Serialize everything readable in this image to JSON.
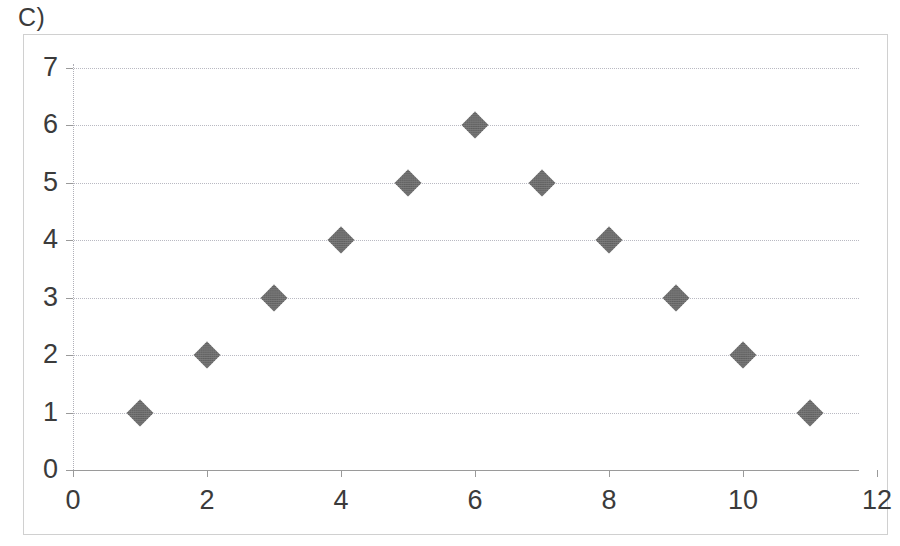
{
  "panel": {
    "label": "C)"
  },
  "chart_data": {
    "type": "scatter",
    "title": "",
    "xlabel": "",
    "ylabel": "",
    "xlim": [
      0,
      12
    ],
    "ylim": [
      0,
      7
    ],
    "grid": true,
    "legend": false,
    "marker": {
      "shape": "diamond",
      "color": "#6e6e6e",
      "size": 19
    },
    "x_ticks": [
      0,
      2,
      4,
      6,
      8,
      10,
      12
    ],
    "x_tick_labels": [
      "0",
      "2",
      "4",
      "6",
      "8",
      "10",
      "12"
    ],
    "y_ticks": [
      0,
      1,
      2,
      3,
      4,
      5,
      6,
      7
    ],
    "y_tick_labels": [
      "0",
      "1",
      "2",
      "3",
      "4",
      "5",
      "6",
      "7"
    ],
    "points": [
      {
        "x": 1,
        "y": 1
      },
      {
        "x": 2,
        "y": 2
      },
      {
        "x": 3,
        "y": 3
      },
      {
        "x": 4,
        "y": 4
      },
      {
        "x": 5,
        "y": 5
      },
      {
        "x": 6,
        "y": 6
      },
      {
        "x": 7,
        "y": 5
      },
      {
        "x": 8,
        "y": 4
      },
      {
        "x": 9,
        "y": 3
      },
      {
        "x": 10,
        "y": 2
      },
      {
        "x": 11,
        "y": 1
      }
    ],
    "series": [
      {
        "name": "Series 1",
        "x": [
          1,
          2,
          3,
          4,
          5,
          6,
          7,
          8,
          9,
          10,
          11
        ],
        "values": [
          1,
          2,
          3,
          4,
          5,
          6,
          5,
          4,
          3,
          2,
          1
        ]
      }
    ]
  },
  "colors": {
    "marker": "#6e6e6e",
    "gridline": "#b9b9c2",
    "axis": "#9a9a9a",
    "frame": "#d0d0d0",
    "text": "#3b3b3b",
    "background": "#ffffff"
  }
}
